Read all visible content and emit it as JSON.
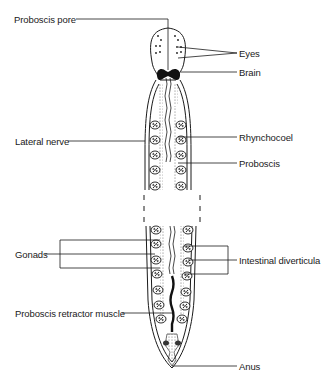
{
  "diagram": {
    "labels": {
      "proboscis_pore": "Proboscis pore",
      "eyes": "Eyes",
      "brain": "Brain",
      "lateral_nerve": "Lateral nerve",
      "rhynchocoel": "Rhynchocoel",
      "proboscis": "Proboscis",
      "gonads": "Gonads",
      "intestinal_diverticula": "Intestinal diverticula",
      "proboscis_retractor_muscle": "Proboscis retractor muscle",
      "anus": "Anus"
    },
    "colors": {
      "ink": "#1a1a1a",
      "stipple": "#9a9a9a",
      "background": "#ffffff"
    }
  }
}
